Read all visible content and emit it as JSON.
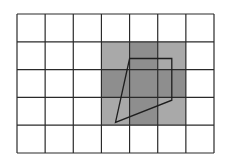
{
  "diagram": {
    "grid": {
      "columns": 7,
      "rows": 5
    },
    "colors": {
      "background": "#ffffff",
      "grid_line": "#2a2a2a",
      "shade_light": "#a9a9a9",
      "shade_dark": "#8e8e8e",
      "shape_stroke": "#1e1e1e"
    },
    "shaded_cells": [
      {
        "col": 3,
        "row": 1,
        "shade": "light"
      },
      {
        "col": 4,
        "row": 1,
        "shade": "dark"
      },
      {
        "col": 5,
        "row": 1,
        "shade": "light"
      },
      {
        "col": 3,
        "row": 2,
        "shade": "dark"
      },
      {
        "col": 4,
        "row": 2,
        "shade": "dark"
      },
      {
        "col": 5,
        "row": 2,
        "shade": "dark"
      },
      {
        "col": 3,
        "row": 3,
        "shade": "light"
      },
      {
        "col": 4,
        "row": 3,
        "shade": "dark"
      },
      {
        "col": 5,
        "row": 3,
        "shade": "light"
      }
    ],
    "quadrilateral": {
      "vertices_grid_units": [
        [
          4.0,
          1.6
        ],
        [
          5.5,
          1.6
        ],
        [
          5.5,
          3.1
        ],
        [
          3.5,
          3.9
        ]
      ]
    }
  }
}
